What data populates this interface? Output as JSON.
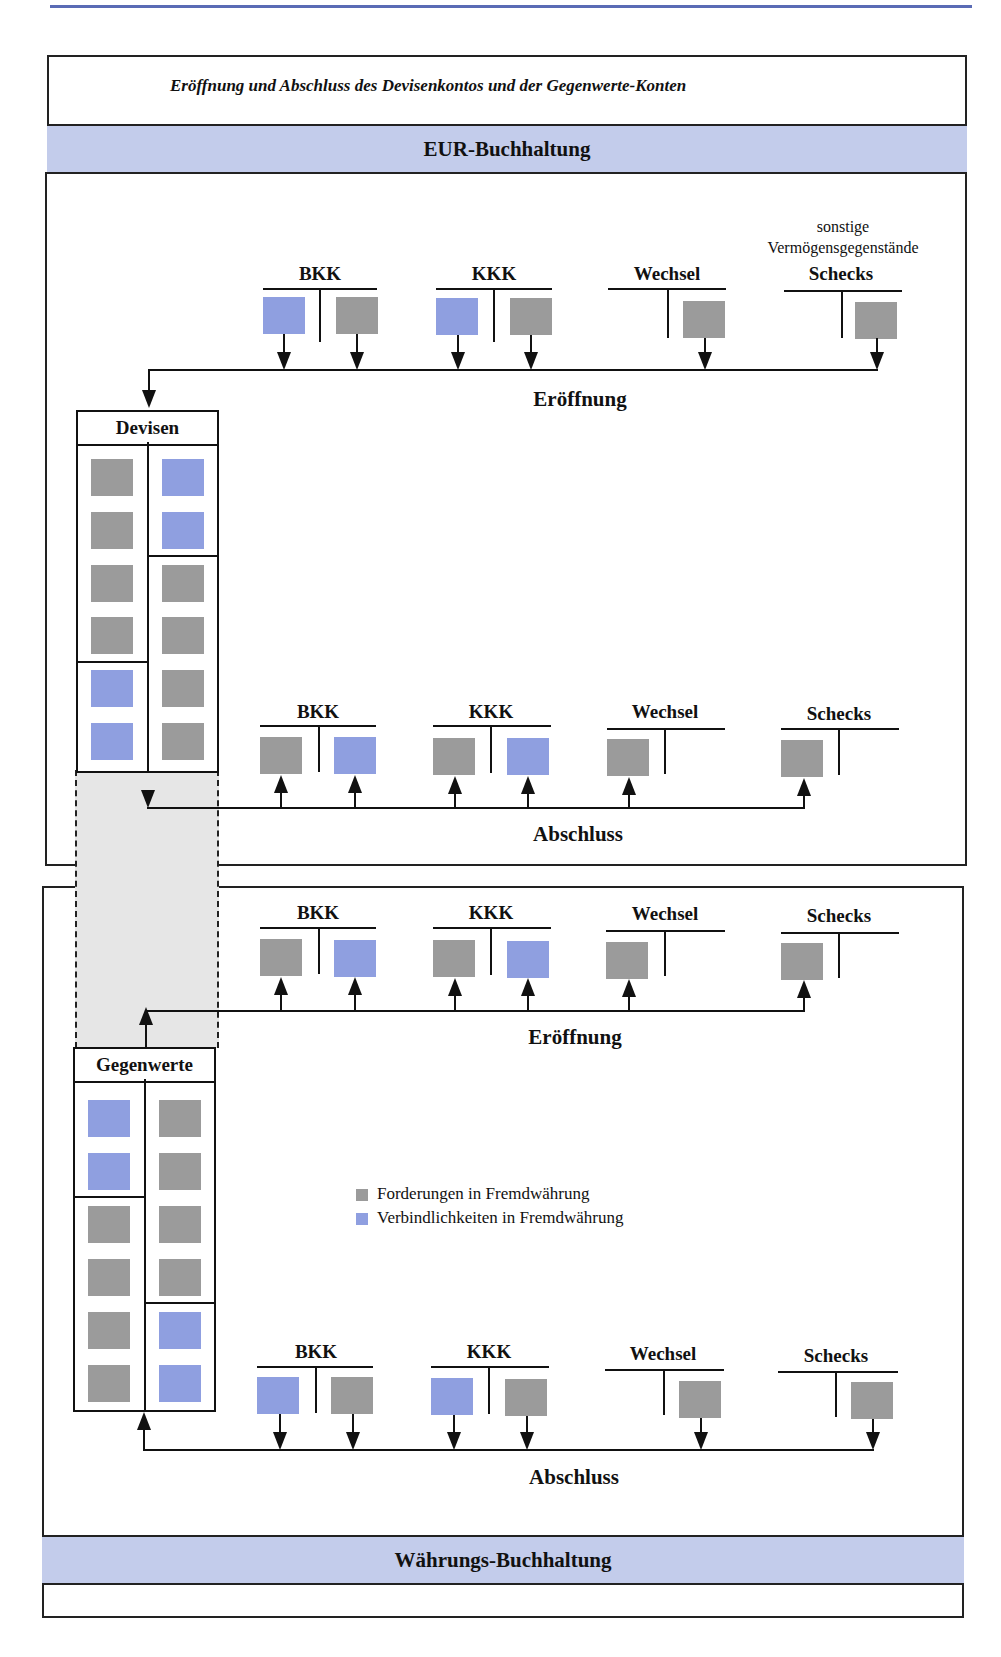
{
  "header": {
    "running_head": "g         g         gsvorfällen mit Kunden",
    "accent_color": "#5a6bb5"
  },
  "diagram": {
    "title": "Eröffnung und Abschluss des Devisenkontos und der Gegenwerte-Konten",
    "sections": {
      "eur": {
        "label": "EUR-Buchhaltung",
        "band_color": "#c3cceb"
      },
      "waehrung": {
        "label": "Währungs-Buchhaltung",
        "band_color": "#c3cceb"
      }
    },
    "group_label_sonstige": "sonstige\nVermögensgegenstände",
    "accounts": [
      "BKK",
      "KKK",
      "Wechsel",
      "Schecks"
    ],
    "phases": {
      "eur_open": "Eröffnung",
      "eur_close": "Abschluss",
      "fx_open": "Eröffnung",
      "fx_close": "Abschluss"
    },
    "central_accounts": {
      "devisen": {
        "label": "Devisen",
        "left": [
          "gray",
          "gray",
          "gray",
          "gray",
          "blue",
          "blue"
        ],
        "right": [
          "blue",
          "blue",
          "gray",
          "gray",
          "gray",
          "gray"
        ]
      },
      "gegenwerte": {
        "label": "Gegenwerte",
        "left": [
          "blue",
          "blue",
          "gray",
          "gray",
          "gray",
          "gray"
        ],
        "right": [
          "gray",
          "gray",
          "gray",
          "gray",
          "blue",
          "blue"
        ]
      }
    },
    "legend": [
      {
        "label": "Forderungen in Fremdwährung",
        "color": "#9b9b9b"
      },
      {
        "label": "Verbindlichkeiten in Fremdwährung",
        "color": "#8f9fe0"
      }
    ]
  }
}
